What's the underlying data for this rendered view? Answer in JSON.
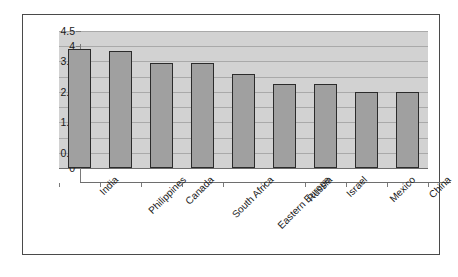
{
  "chart_data": {
    "type": "bar",
    "title": "",
    "subtitle": "",
    "xlabel": "",
    "ylabel": "",
    "categories": [
      "India",
      "Philippines",
      "Canada",
      "South Africa",
      "Eastern Europe",
      "Russia",
      "Israel",
      "Mexico",
      "China"
    ],
    "values": [
      3.9,
      3.85,
      3.45,
      3.45,
      3.1,
      2.75,
      2.75,
      2.5,
      2.5
    ],
    "ylim": [
      0,
      4.5
    ],
    "ytick_labels": [
      "4.5",
      "4",
      "3.5",
      "3",
      "2.5",
      "2",
      "1.5",
      "1",
      "0.5",
      "0"
    ],
    "ytick_values": [
      4.5,
      4,
      3.5,
      3,
      2.5,
      2,
      1.5,
      1,
      0.5,
      0
    ],
    "grid": true,
    "legend": null,
    "legend_position": "none",
    "series": [
      {
        "name": "Series 1",
        "values": [
          3.9,
          3.85,
          3.45,
          3.45,
          3.1,
          2.75,
          2.75,
          2.5,
          2.5
        ]
      }
    ],
    "annotations": [],
    "colors": {
      "bar_fill": "#a0a0a0",
      "bar_border": "#2b2b2b",
      "plot_background": "#d2d2d2",
      "gridline": "#a9a9a9",
      "axis_line": "#6e6e6e",
      "figure_border": "#4a4a4a",
      "figure_background": "#ffffff",
      "text": "#1a1a1a"
    },
    "label_rotation_deg": -45
  }
}
